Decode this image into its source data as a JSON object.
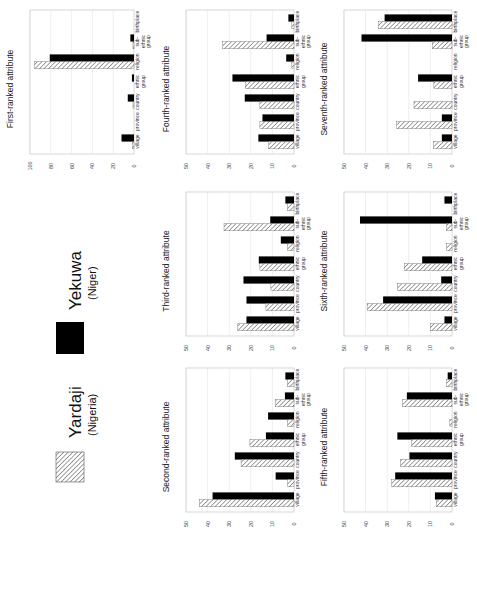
{
  "legend": {
    "items": [
      {
        "name": "Yekuwa",
        "subtitle": "(Niger)",
        "pattern": "solid",
        "color": "#000000"
      },
      {
        "name": "Yardaji",
        "subtitle": "(Nigeria)",
        "pattern": "hatched",
        "color": "#555555"
      }
    ]
  },
  "chart_data": [
    {
      "type": "bar",
      "title": "First-ranked attribute",
      "categories": [
        "village",
        "province",
        "country",
        "ethnic group",
        "religion",
        "sub-ethnic group",
        "birthplace"
      ],
      "series": [
        {
          "name": "Yardaji (Nigeria)",
          "values": [
            1.5,
            0,
            1,
            0,
            95.5,
            1,
            0
          ]
        },
        {
          "name": "Yekuwa (Niger)",
          "values": [
            12,
            0,
            6,
            2,
            81,
            3.5,
            0
          ]
        }
      ],
      "ylim": [
        0,
        100
      ],
      "yticks": [
        0,
        20,
        40,
        60,
        80,
        100
      ],
      "xlabel": "",
      "ylabel": "",
      "grid": true,
      "orientation": "rotated-90"
    },
    {
      "type": "bar",
      "title": "Second-ranked attribute",
      "categories": [
        "village",
        "province",
        "country",
        "ethnic group",
        "religion",
        "sub-ethnic group",
        "birthplace"
      ],
      "series": [
        {
          "name": "Yardaji (Nigeria)",
          "values": [
            43.8,
            3,
            24.5,
            20.4,
            3,
            8.5,
            3
          ]
        },
        {
          "name": "Yekuwa (Niger)",
          "values": [
            37.7,
            8.5,
            27.4,
            13,
            12,
            4.2,
            4
          ]
        }
      ],
      "ylim": [
        0,
        50
      ],
      "yticks": [
        0,
        10,
        20,
        30,
        40,
        50
      ],
      "xlabel": "",
      "ylabel": "",
      "grid": true,
      "orientation": "rotated-90"
    },
    {
      "type": "bar",
      "title": "Third-ranked attribute",
      "categories": [
        "village",
        "province",
        "country",
        "ethnic group",
        "religion",
        "sub-ethnic group",
        "birthplace"
      ],
      "series": [
        {
          "name": "Yardaji (Nigeria)",
          "values": [
            26,
            13,
            10.7,
            15.8,
            3,
            32.4,
            3
          ]
        },
        {
          "name": "Yekuwa (Niger)",
          "values": [
            22,
            22,
            23.4,
            16.3,
            6.1,
            11,
            4
          ]
        }
      ],
      "ylim": [
        0,
        50
      ],
      "yticks": [
        0,
        10,
        20,
        30,
        40,
        50
      ],
      "xlabel": "",
      "ylabel": "",
      "grid": true,
      "orientation": "rotated-90"
    },
    {
      "type": "bar",
      "title": "Fourth-ranked attribute",
      "categories": [
        "village",
        "province",
        "country",
        "ethnic group",
        "religion",
        "sub-ethnic group",
        "birthplace"
      ],
      "series": [
        {
          "name": "Yardaji (Nigeria)",
          "values": [
            11.7,
            15.8,
            15.8,
            22.6,
            1,
            33,
            1
          ]
        },
        {
          "name": "Yekuwa (Niger)",
          "values": [
            16.5,
            14.6,
            22.8,
            28.5,
            3.6,
            12.7,
            2.6
          ]
        }
      ],
      "ylim": [
        0,
        50
      ],
      "yticks": [
        0,
        10,
        20,
        30,
        40,
        50
      ],
      "xlabel": "",
      "ylabel": "",
      "grid": true,
      "orientation": "rotated-90"
    },
    {
      "type": "bar",
      "title": "Fifth-ranked attribute",
      "categories": [
        "village",
        "province",
        "country",
        "ethnic group",
        "religion",
        "sub-ethnic group",
        "birthplace"
      ],
      "series": [
        {
          "name": "Yardaji (Nigeria)",
          "values": [
            7.2,
            27.9,
            23.8,
            18.7,
            1,
            22.8,
            2.5
          ]
        },
        {
          "name": "Yekuwa (Niger)",
          "values": [
            7.9,
            26.3,
            19.7,
            25.3,
            0,
            20.9,
            2
          ]
        }
      ],
      "ylim": [
        0,
        50
      ],
      "yticks": [
        0,
        10,
        20,
        30,
        40,
        50
      ],
      "xlabel": "",
      "ylabel": "",
      "grid": true,
      "orientation": "rotated-90"
    },
    {
      "type": "bar",
      "title": "Sixth-ranked attribute",
      "categories": [
        "village",
        "province",
        "country",
        "ethnic group",
        "religion",
        "sub-ethnic group",
        "birthplace"
      ],
      "series": [
        {
          "name": "Yardaji (Nigeria)",
          "values": [
            10,
            39.3,
            25.3,
            22,
            2.5,
            2.5,
            0
          ]
        },
        {
          "name": "Yekuwa (Niger)",
          "values": [
            3.5,
            31.9,
            5,
            13.8,
            0,
            42.6,
            3.5
          ]
        }
      ],
      "ylim": [
        0,
        50
      ],
      "yticks": [
        0,
        10,
        20,
        30,
        40,
        50
      ],
      "xlabel": "",
      "ylabel": "",
      "grid": true,
      "orientation": "rotated-90"
    },
    {
      "type": "bar",
      "title": "Seventh-ranked attribute",
      "categories": [
        "village",
        "province",
        "country",
        "ethnic group",
        "religion",
        "sub-ethnic group",
        "birthplace"
      ],
      "series": [
        {
          "name": "Yardaji (Nigeria)",
          "values": [
            8.5,
            25.6,
            17.6,
            8.4,
            0,
            9.1,
            34.1
          ]
        },
        {
          "name": "Yekuwa (Niger)",
          "values": [
            4.7,
            4.7,
            0,
            15.7,
            0,
            41.9,
            31.2
          ]
        }
      ],
      "ylim": [
        0,
        50
      ],
      "yticks": [
        0,
        10,
        20,
        30,
        40,
        50
      ],
      "xlabel": "",
      "ylabel": "",
      "grid": true,
      "orientation": "rotated-90"
    }
  ]
}
